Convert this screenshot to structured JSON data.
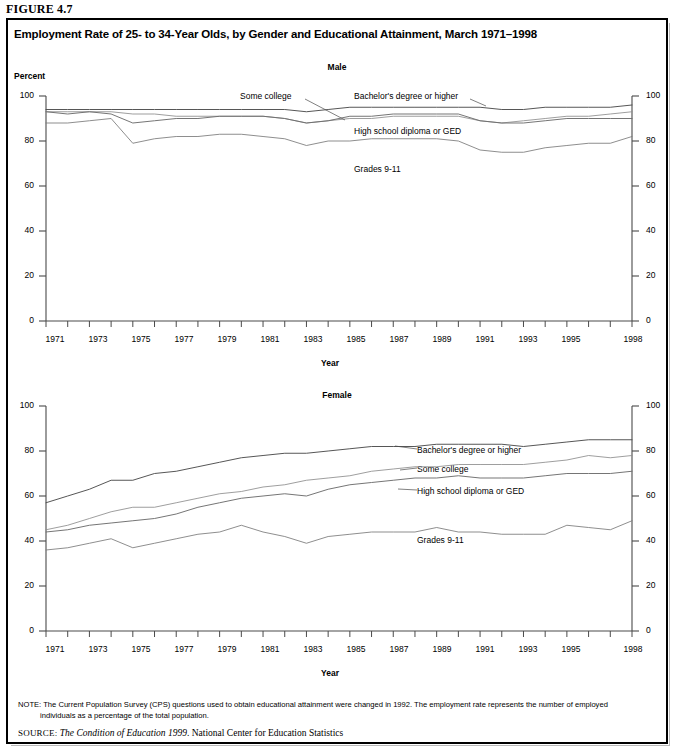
{
  "figure": {
    "label": "FIGURE 4.7",
    "title": "Employment Rate of 25- to 34-Year Olds, by Gender and Educational Attainment, March 1971–1998"
  },
  "notes": {
    "note_prefix": "NOTE:",
    "note_text": "The Current Population Survey (CPS) questions used to obtain educational attainment were changed in 1992.  The employment rate represents the number of employed",
    "note_text_line2": "individuals as a percentage of the total population.",
    "source_prefix": "SOURCE:",
    "source_italic": "The Condition of Education 1999",
    "source_rest": ". National Center for Education Statistics"
  },
  "axis": {
    "y_title": "Percent",
    "x_title": "Year",
    "y_ticks": [
      0,
      20,
      40,
      60,
      80,
      100
    ],
    "x_ticks": [
      "1971",
      "1973",
      "1975",
      "1977",
      "1979",
      "1981",
      "1983",
      "1985",
      "1987",
      "1989",
      "1991",
      "1993",
      "1995",
      "1998"
    ],
    "ylim": [
      0,
      100
    ],
    "xlim": [
      1971,
      1998
    ]
  },
  "colors": {
    "bachelors": "#4d4d4d",
    "some_college": "#8c8c8c",
    "high_school": "#6e6e6e",
    "grades_9_11": "#7a7a7a",
    "axis": "#4a4a4a",
    "frame": "#000000"
  },
  "chart_data": [
    {
      "type": "line",
      "title": "Male",
      "xlabel": "Year",
      "ylabel": "Percent",
      "ylim": [
        0,
        100
      ],
      "grid": false,
      "legend": "inline-annotations",
      "x": [
        1971,
        1972,
        1973,
        1974,
        1975,
        1976,
        1977,
        1978,
        1979,
        1980,
        1981,
        1982,
        1983,
        1984,
        1985,
        1986,
        1987,
        1988,
        1989,
        1990,
        1991,
        1992,
        1993,
        1994,
        1995,
        1996,
        1997,
        1998
      ],
      "series": [
        {
          "name": "Bachelor's degree or higher",
          "values": [
            94,
            94,
            94,
            94,
            94,
            94,
            94,
            94,
            94,
            94,
            94,
            94,
            93,
            94,
            95,
            95,
            95,
            95,
            95,
            95,
            95,
            94,
            94,
            95,
            95,
            95,
            95,
            96
          ]
        },
        {
          "name": "Some college",
          "values": [
            93,
            93,
            93,
            93,
            92,
            92,
            91,
            91,
            91,
            91,
            91,
            90,
            88,
            89,
            90,
            90,
            91,
            91,
            91,
            91,
            89,
            88,
            89,
            90,
            91,
            91,
            92,
            93
          ]
        },
        {
          "name": "High school diploma or GED",
          "values": [
            93,
            92,
            93,
            92,
            88,
            89,
            90,
            90,
            91,
            91,
            91,
            90,
            88,
            89,
            91,
            91,
            92,
            92,
            92,
            92,
            89,
            88,
            88,
            89,
            90,
            90,
            90,
            90
          ]
        },
        {
          "name": "Grades 9-11",
          "values": [
            88,
            88,
            89,
            90,
            79,
            81,
            82,
            82,
            83,
            83,
            82,
            81,
            78,
            80,
            80,
            81,
            81,
            81,
            81,
            80,
            76,
            75,
            75,
            77,
            78,
            79,
            79,
            82
          ]
        }
      ]
    },
    {
      "type": "line",
      "title": "Female",
      "xlabel": "Year",
      "ylabel": "",
      "ylim": [
        0,
        100
      ],
      "grid": false,
      "legend": "inline-annotations",
      "x": [
        1971,
        1972,
        1973,
        1974,
        1975,
        1976,
        1977,
        1978,
        1979,
        1980,
        1981,
        1982,
        1983,
        1984,
        1985,
        1986,
        1987,
        1988,
        1989,
        1990,
        1991,
        1992,
        1993,
        1994,
        1995,
        1996,
        1997,
        1998
      ],
      "series": [
        {
          "name": "Bachelor's degree or higher",
          "values": [
            57,
            60,
            63,
            67,
            67,
            70,
            71,
            73,
            75,
            77,
            78,
            79,
            79,
            80,
            81,
            82,
            82,
            82,
            83,
            83,
            83,
            83,
            82,
            83,
            84,
            85,
            85,
            85
          ]
        },
        {
          "name": "Some college",
          "values": [
            45,
            47,
            50,
            53,
            55,
            55,
            57,
            59,
            61,
            62,
            64,
            65,
            67,
            68,
            69,
            71,
            72,
            73,
            73,
            74,
            74,
            74,
            74,
            75,
            76,
            78,
            77,
            78
          ]
        },
        {
          "name": "High school diploma or GED",
          "values": [
            44,
            45,
            47,
            48,
            49,
            50,
            52,
            55,
            57,
            59,
            60,
            61,
            60,
            63,
            65,
            66,
            67,
            68,
            68,
            69,
            68,
            68,
            68,
            69,
            70,
            70,
            70,
            71
          ]
        },
        {
          "name": "Grades 9-11",
          "values": [
            36,
            37,
            39,
            41,
            37,
            39,
            41,
            43,
            44,
            47,
            44,
            42,
            39,
            42,
            43,
            44,
            44,
            44,
            46,
            44,
            44,
            43,
            43,
            43,
            47,
            46,
            45,
            49
          ]
        }
      ]
    }
  ],
  "annotations": {
    "male": [
      {
        "text": "Some college",
        "series": "some_college"
      },
      {
        "text": "Bachelor's degree or higher",
        "series": "bachelors"
      },
      {
        "text": "High school diploma or GED",
        "series": "high_school"
      },
      {
        "text": "Grades 9-11",
        "series": "grades_9_11"
      }
    ],
    "female": [
      {
        "text": "Bachelor's degree or higher",
        "series": "bachelors"
      },
      {
        "text": "Some college",
        "series": "some_college"
      },
      {
        "text": "High school diploma or GED",
        "series": "high_school"
      },
      {
        "text": "Grades 9-11",
        "series": "grades_9_11"
      }
    ]
  }
}
